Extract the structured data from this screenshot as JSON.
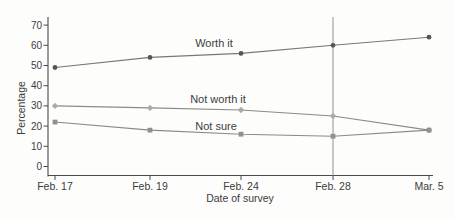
{
  "figure": {
    "background": "#fdfdfc",
    "axis_color": "#4a4a4a",
    "text_color": "#3c3c3c",
    "reference_line_color": "#9c9c9c"
  },
  "chart_data": {
    "type": "line",
    "title": "",
    "x": [
      "Feb. 17",
      "Feb. 19",
      "Feb. 24",
      "Feb. 28",
      "Mar. 5"
    ],
    "xlabel": "Date of survey",
    "ylabel": "Percentage",
    "ylim": [
      0,
      70
    ],
    "yticks": [
      0,
      10,
      20,
      30,
      40,
      50,
      60,
      70
    ],
    "grid": false,
    "legend_position": "inline-labels",
    "series": [
      {
        "name": "Worth it",
        "marker": "circle",
        "line_color": "#787878",
        "marker_color": "#565656",
        "values": [
          49,
          54,
          56,
          60,
          64
        ]
      },
      {
        "name": "Not worth it",
        "marker": "diamond",
        "line_color": "#8a8a8a",
        "marker_color": "#ababab",
        "values": [
          30,
          29,
          28,
          25,
          18
        ]
      },
      {
        "name": "Not sure",
        "marker": "square",
        "line_color": "#8a8a8a",
        "marker_color": "#909090",
        "values": [
          22,
          18,
          16,
          15,
          18
        ]
      }
    ],
    "annotations": [
      {
        "type": "vline",
        "at_x": "Feb. 28"
      }
    ]
  }
}
